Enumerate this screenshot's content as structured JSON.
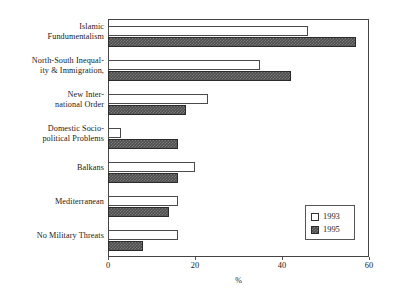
{
  "chart_data": {
    "type": "bar",
    "orientation": "horizontal",
    "title": "",
    "xlabel": "%",
    "ylabel": "",
    "xlim": [
      0,
      60
    ],
    "xticks": [
      0,
      20,
      40,
      60
    ],
    "xtick_labels": [
      "0",
      "20",
      "40",
      "60"
    ],
    "grid": false,
    "legend_position": "lower-right",
    "categories": [
      "Islamic Fundumentalism",
      "North-South Inequality & Immigration,",
      "New International Order",
      "Domestic Socio-political Problems",
      "Balkans",
      "Mediterranean",
      "No Military Threats"
    ],
    "category_label_lines": [
      [
        "Islamic",
        "Fundumentalism"
      ],
      [
        "North-South Inequal-",
        "ity & Immigration,"
      ],
      [
        "New Inter-",
        "national Order"
      ],
      [
        "Domestic Socio-",
        "political Problems"
      ],
      [
        "Balkans"
      ],
      [
        "Mediterranean"
      ],
      [
        "No Military Threats"
      ]
    ],
    "series": [
      {
        "name": "1993",
        "color": "#ffffff",
        "values": [
          46,
          35,
          23,
          3,
          20,
          16,
          16
        ]
      },
      {
        "name": "1995",
        "color": "#4d4d4d",
        "values": [
          57,
          42,
          18,
          16,
          16,
          14,
          8
        ]
      }
    ]
  },
  "legend": {
    "items": [
      {
        "label": "1993"
      },
      {
        "label": "1995"
      }
    ]
  },
  "axis": {
    "x_title": "%"
  }
}
